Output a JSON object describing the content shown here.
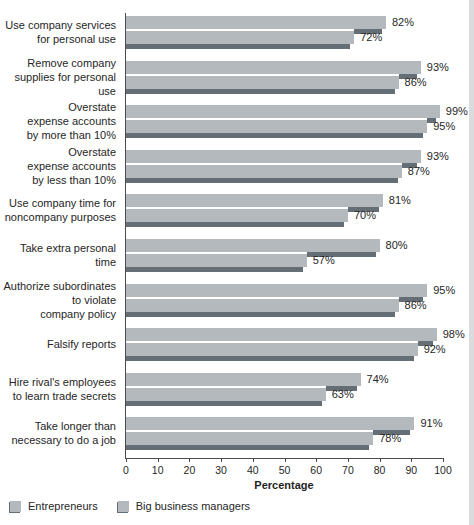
{
  "chart_data": {
    "type": "bar",
    "orientation": "horizontal",
    "xlabel": "Percentage",
    "xlim": [
      0,
      100
    ],
    "xticks": [
      0,
      10,
      20,
      30,
      40,
      50,
      60,
      70,
      80,
      90,
      100
    ],
    "value_suffix": "%",
    "grid": false,
    "legend_position": "bottom-left",
    "categories": [
      [
        "Use company services",
        "for personal use"
      ],
      [
        "Remove company",
        "supplies for personal use"
      ],
      [
        "Overstate",
        "expense accounts",
        "by more than 10%"
      ],
      [
        "Overstate",
        "expense accounts",
        "by less than 10%"
      ],
      [
        "Use company time for",
        "noncompany purposes"
      ],
      [
        "Take extra personal time"
      ],
      [
        "Authorize subordinates",
        "to violate",
        "company policy"
      ],
      [
        "Falsify reports"
      ],
      [
        "Hire rival's employees",
        "to learn trade secrets"
      ],
      [
        "Take longer than",
        "necessary to do a job"
      ]
    ],
    "series": [
      {
        "name": "Entrepreneurs",
        "values": [
          82,
          93,
          99,
          93,
          81,
          80,
          95,
          98,
          74,
          91
        ]
      },
      {
        "name": "Big business managers",
        "values": [
          72,
          86,
          95,
          87,
          70,
          57,
          86,
          92,
          63,
          78
        ]
      }
    ],
    "colors": {
      "bar": "#b4b9bd",
      "bar_shadow": "#656e74",
      "axis": "#4c4c4c",
      "text": "#262626",
      "background": "#ffffff",
      "scan_edge": "#d9dbdc"
    }
  }
}
